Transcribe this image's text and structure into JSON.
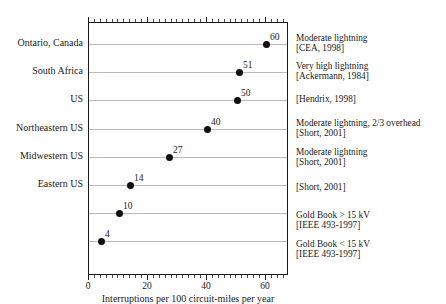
{
  "chart_data": {
    "type": "scatter",
    "title": "",
    "subtitle": "",
    "xlabel": "Interruptions per 100 circuit-miles per year",
    "ylabel": "",
    "xlim": [
      0,
      67.8
    ],
    "grid": true,
    "legend_position": "none",
    "xticks_major": [
      0,
      20,
      40,
      60
    ],
    "xtick_labels": [
      "0",
      "20",
      "40",
      "60"
    ],
    "xtick_minor_step": 2,
    "categories": [
      "Ontario, Canada",
      "South Africa",
      "US",
      "Northeastern US",
      "Midwestern US",
      "Eastern US",
      "",
      ""
    ],
    "values": [
      60,
      51,
      50,
      40,
      27,
      14,
      10,
      4
    ],
    "point_labels": [
      "60",
      "51",
      "50",
      "40",
      "27",
      "14",
      "10",
      "4"
    ],
    "annotations": [
      {
        "line1": "Moderate lightning",
        "line2": "[CEA, 1998]"
      },
      {
        "line1": "Very high lightning",
        "line2": "[Ackermann, 1984]"
      },
      {
        "line1": "[Hendrix, 1998]",
        "line2": ""
      },
      {
        "line1": "Moderate lightning, 2/3 overhead",
        "line2": "[Short, 2001]"
      },
      {
        "line1": "Moderate lightning",
        "line2": "[Short, 2001]"
      },
      {
        "line1": "[Short, 2001]",
        "line2": ""
      },
      {
        "line1": "Gold Book > 15 kV",
        "line2": "[IEEE 493-1997]"
      },
      {
        "line1": "Gold Book < 15 kV",
        "line2": "[IEEE 493-1997]"
      }
    ],
    "colors": {
      "marker": "#101010",
      "gridline": "#b9b9b9",
      "axis": "#1a1a1a",
      "text": "#1a1a1a",
      "background": "#ffffff"
    }
  }
}
